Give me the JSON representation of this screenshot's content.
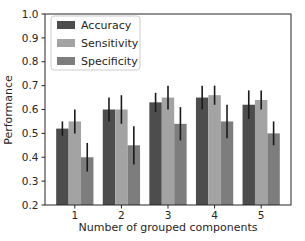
{
  "chart_data": {
    "type": "bar",
    "title": "",
    "xlabel": "Number of grouped components",
    "ylabel": "Performance",
    "categories": [
      "1",
      "2",
      "3",
      "4",
      "5"
    ],
    "series": [
      {
        "name": "Accuracy",
        "color": "#4d4d4d",
        "values": [
          0.52,
          0.6,
          0.63,
          0.65,
          0.62
        ],
        "errors": [
          0.03,
          0.05,
          0.04,
          0.05,
          0.06
        ]
      },
      {
        "name": "Sensitivity",
        "color": "#a3a3a3",
        "values": [
          0.55,
          0.6,
          0.65,
          0.66,
          0.64
        ],
        "errors": [
          0.05,
          0.06,
          0.05,
          0.04,
          0.04
        ]
      },
      {
        "name": "Specificity",
        "color": "#7d7d7d",
        "values": [
          0.4,
          0.45,
          0.54,
          0.55,
          0.5
        ],
        "errors": [
          0.06,
          0.08,
          0.07,
          0.07,
          0.05
        ]
      }
    ],
    "ylim": [
      0.2,
      1.0
    ],
    "yticks": [
      "0.2",
      "0.3",
      "0.4",
      "0.5",
      "0.6",
      "0.7",
      "0.8",
      "0.9",
      "1.0"
    ],
    "xlim": [
      0.36,
      5.64
    ],
    "grid": false,
    "legend_position": "upper-left",
    "bar_group_width_fraction": 0.8,
    "error_color": "#1a1a1a",
    "axis_color": "#262626",
    "legend_border_color": "#cccccc",
    "background": "#ffffff"
  }
}
